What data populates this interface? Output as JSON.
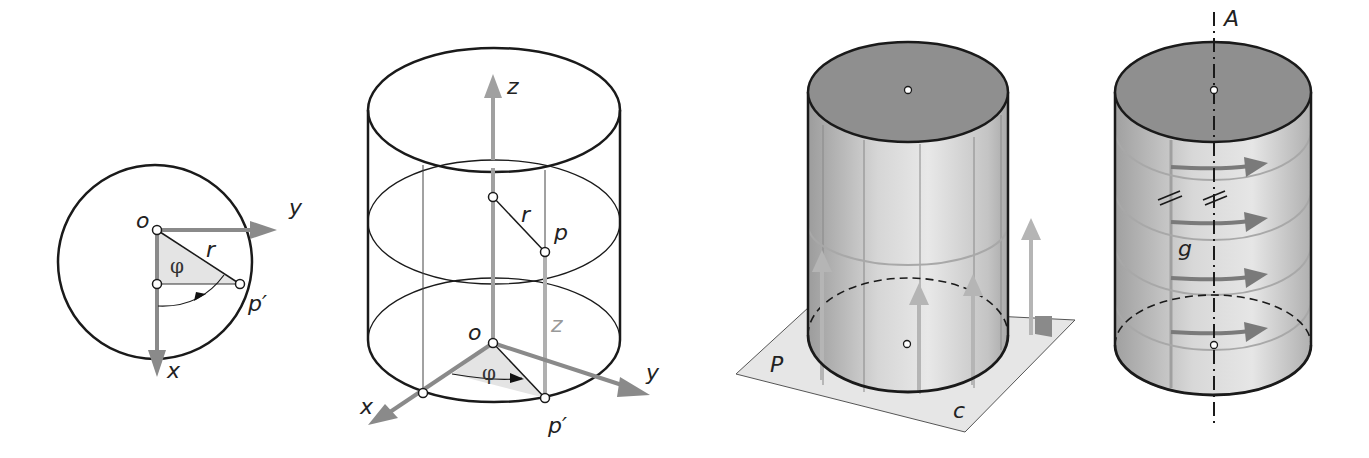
{
  "figures": [
    {
      "id": "polar-circle",
      "labels": {
        "origin": "o",
        "y_axis": "y",
        "x_axis": "x",
        "radius": "r",
        "angle": "φ",
        "point": "p′"
      }
    },
    {
      "id": "cylinder-coordinates",
      "labels": {
        "z_axis": "z",
        "radius": "r",
        "point": "p",
        "height": "z",
        "origin": "o",
        "angle": "φ",
        "x_axis": "x",
        "y_axis": "y",
        "projected_point": "p′"
      }
    },
    {
      "id": "cylinder-on-plane",
      "labels": {
        "plane": "P",
        "curve": "c"
      }
    },
    {
      "id": "cylinder-rotation-axis",
      "labels": {
        "axis": "A",
        "generator": "g"
      }
    }
  ],
  "colors": {
    "stroke": "#1a1a1a",
    "axis_gray": "#8a8a8a",
    "light_gray": "#b5b5b5",
    "top_fill": "#8f8f8f",
    "plane_fill": "#e6e6e6",
    "triangle_fill": "#e4e4e4"
  }
}
